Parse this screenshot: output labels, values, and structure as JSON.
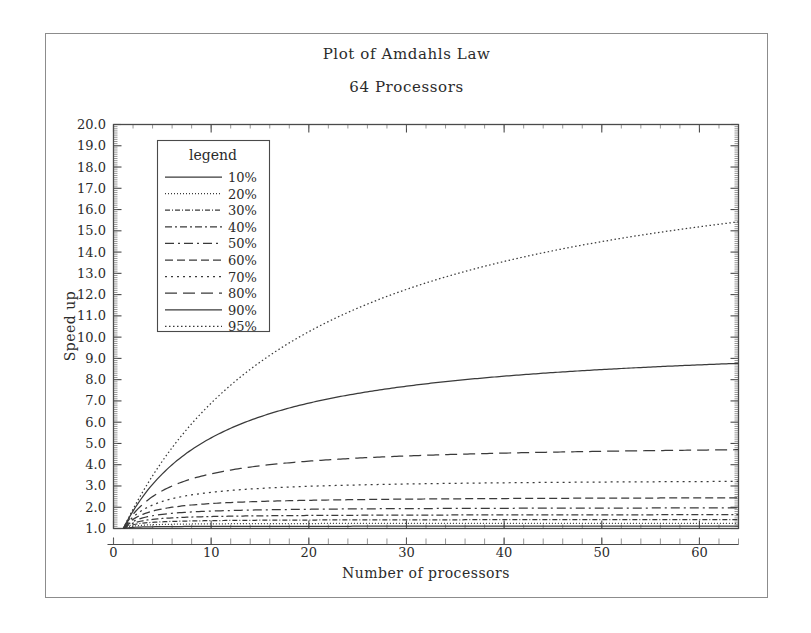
{
  "figure": {
    "title": "Plot of Amdahls Law",
    "subtitle": "64 Processors"
  },
  "legend": {
    "title": "legend"
  },
  "chart_data": {
    "type": "line",
    "title": "Plot of Amdahls Law",
    "subtitle": "64 Processors",
    "xlabel": "Number of processors",
    "ylabel": "Speed up",
    "xlim": [
      0,
      64
    ],
    "ylim": [
      1.0,
      20.0
    ],
    "grid": false,
    "legend_position": "upper-left-inside",
    "legend_title": "legend",
    "x_ticks": [
      0,
      10,
      20,
      30,
      40,
      50,
      60
    ],
    "x_tick_labels": [
      "0",
      "10",
      "20",
      "30",
      "40",
      "50",
      "60"
    ],
    "x_minor_tick_step": 2,
    "y_ticks": [
      1.0,
      2.0,
      3.0,
      4.0,
      5.0,
      6.0,
      7.0,
      8.0,
      9.0,
      10.0,
      11.0,
      12.0,
      13.0,
      14.0,
      15.0,
      16.0,
      17.0,
      18.0,
      19.0,
      20.0
    ],
    "y_tick_labels": [
      "1.0",
      "2.0",
      "3.0",
      "4.0",
      "5.0",
      "6.0",
      "7.0",
      "8.0",
      "9.0",
      "10.0",
      "11.0",
      "12.0",
      "13.0",
      "14.0",
      "15.0",
      "16.0",
      "17.0",
      "18.0",
      "19.0",
      "20.0"
    ],
    "formula": "S(N) = 1 / ((1 - p) + p / N)",
    "x": [
      1,
      2,
      4,
      8,
      12,
      16,
      20,
      24,
      28,
      32,
      40,
      48,
      56,
      64
    ],
    "series": [
      {
        "name": "10%",
        "parallel_fraction": 0.1,
        "dash": "solid",
        "dasharray": "none",
        "values": [
          1.0,
          1.05,
          1.08,
          1.1,
          1.1,
          1.1,
          1.11,
          1.11,
          1.11,
          1.11,
          1.11,
          1.11,
          1.11,
          1.11
        ]
      },
      {
        "name": "20%",
        "parallel_fraction": 0.2,
        "dash": "fine-dotted",
        "dasharray": "1,2",
        "values": [
          1.0,
          1.11,
          1.18,
          1.21,
          1.22,
          1.23,
          1.23,
          1.24,
          1.24,
          1.24,
          1.24,
          1.24,
          1.24,
          1.24
        ]
      },
      {
        "name": "30%",
        "parallel_fraction": 0.3,
        "dash": "dash-dot-fine",
        "dasharray": "5,2,1,2",
        "values": [
          1.0,
          1.18,
          1.3,
          1.36,
          1.38,
          1.39,
          1.4,
          1.4,
          1.4,
          1.4,
          1.41,
          1.41,
          1.41,
          1.41
        ]
      },
      {
        "name": "40%",
        "parallel_fraction": 0.4,
        "dash": "long-dash-dot",
        "dasharray": "7,3,2,3",
        "values": [
          1.0,
          1.25,
          1.43,
          1.54,
          1.58,
          1.6,
          1.61,
          1.61,
          1.62,
          1.62,
          1.63,
          1.63,
          1.63,
          1.64
        ]
      },
      {
        "name": "50%",
        "parallel_fraction": 0.5,
        "dash": "dash-dot-long",
        "dasharray": "9,4,2,4",
        "values": [
          1.0,
          1.33,
          1.6,
          1.78,
          1.85,
          1.88,
          1.9,
          1.92,
          1.93,
          1.94,
          1.95,
          1.96,
          1.96,
          1.97
        ]
      },
      {
        "name": "60%",
        "parallel_fraction": 0.6,
        "dash": "medium-dash",
        "dasharray": "8,4",
        "values": [
          1.0,
          1.43,
          1.82,
          2.11,
          2.22,
          2.29,
          2.33,
          2.35,
          2.37,
          2.38,
          2.4,
          2.42,
          2.42,
          2.44
        ]
      },
      {
        "name": "70%",
        "parallel_fraction": 0.7,
        "dash": "dotted",
        "dasharray": "2,4",
        "values": [
          1.0,
          1.54,
          2.11,
          2.58,
          2.78,
          2.91,
          2.99,
          3.04,
          3.08,
          3.11,
          3.15,
          3.17,
          3.19,
          3.22
        ]
      },
      {
        "name": "80%",
        "parallel_fraction": 0.8,
        "dash": "long-dash",
        "dasharray": "12,6",
        "values": [
          1.0,
          1.67,
          2.5,
          3.33,
          3.75,
          4.0,
          4.17,
          4.29,
          4.38,
          4.44,
          4.55,
          4.62,
          4.67,
          4.71
        ]
      },
      {
        "name": "90%",
        "parallel_fraction": 0.9,
        "dash": "solid",
        "dasharray": "none",
        "values": [
          1.0,
          1.82,
          3.08,
          4.71,
          5.71,
          6.4,
          6.9,
          7.27,
          7.57,
          7.8,
          8.14,
          8.38,
          8.55,
          8.77
        ]
      },
      {
        "name": "95%",
        "parallel_fraction": 0.95,
        "dash": "fine-dotted",
        "dasharray": "1.5,2.5",
        "values": [
          1.0,
          1.9,
          3.48,
          5.93,
          7.74,
          9.14,
          10.26,
          11.17,
          11.93,
          12.55,
          13.56,
          14.31,
          14.89,
          15.42
        ]
      }
    ]
  }
}
